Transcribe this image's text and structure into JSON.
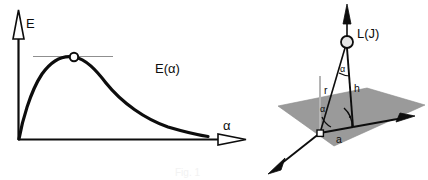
{
  "figure": {
    "kind": "two-panel-scientific-diagram",
    "background_color": "#ffffff",
    "ink_color": "#0d0d0d",
    "plane_fill_color": "#9a9a9a",
    "plane_edge_color": "#8c8c8c",
    "tangent_line_color": "#8f8f8f",
    "reference_line_color": "#b5b5b5",
    "marker_fill_color": "#ffffff",
    "caption": {
      "text": "Fig. 1",
      "visible": "partially-cropped-faint"
    }
  },
  "left_panel": {
    "name": "energy-vs-angle-plot",
    "axes": {
      "y_label": "E",
      "x_label": "α",
      "y_arrow_style": "hollow",
      "x_arrow_style": "hollow",
      "origin": {
        "x": 18,
        "y": 140
      },
      "y_axis_top": {
        "x": 18,
        "y": 14
      },
      "x_axis_end": {
        "x": 245,
        "y": 140
      }
    },
    "curve": {
      "label": "E(α)",
      "label_position": {
        "x": 155,
        "y": 72
      },
      "stroke_width": 3.2
    },
    "maximum_marker": {
      "name": "curve-maximum-point",
      "shape": "open-circle",
      "position": {
        "x": 74,
        "y": 57
      },
      "radius": 4.2
    },
    "tangent_line": {
      "name": "horizontal-tangent-at-maximum",
      "from": {
        "x": 33,
        "y": 56
      },
      "to": {
        "x": 113,
        "y": 56
      }
    }
  },
  "right_panel": {
    "name": "three-dimensional-geometry-diagram",
    "source_label": "L(J)",
    "source_label_position": {
      "x": 357,
      "y": 36
    },
    "source_marker": {
      "name": "light-source-point",
      "shape": "open-circle",
      "position": {
        "x": 347,
        "y": 42
      },
      "radius": 6
    },
    "base_marker": {
      "name": "observation-point",
      "shape": "open-square",
      "position": {
        "x": 320,
        "y": 133
      },
      "size": 6
    },
    "segments": [
      {
        "name": "slant-distance",
        "label": "r",
        "label_position": {
          "x": 327,
          "y": 90
        }
      },
      {
        "name": "source-height",
        "label": "h",
        "label_position": {
          "x": 352,
          "y": 89
        }
      },
      {
        "name": "ground-distance",
        "label": "a",
        "label_position": {
          "x": 337,
          "y": 140
        }
      }
    ],
    "angles": [
      {
        "name": "zenith-angle-at-source",
        "label": "α",
        "label_position": {
          "x": 340,
          "y": 70
        }
      },
      {
        "name": "elevation-angle-at-base",
        "label": "α",
        "label_position": {
          "x": 323,
          "y": 108
        }
      }
    ],
    "right_angle_marker": {
      "name": "right-angle-indicator",
      "position": {
        "x": 353,
        "y": 117
      }
    },
    "plane": {
      "name": "ground-plane",
      "corners": [
        {
          "x": 278,
          "y": 106
        },
        {
          "x": 367,
          "y": 88
        },
        {
          "x": 425,
          "y": 105
        },
        {
          "x": 334,
          "y": 146
        }
      ]
    },
    "axis_arrows": [
      {
        "name": "vertical-axis-arrow",
        "direction": "up",
        "style": "solid"
      },
      {
        "name": "front-left-axis-arrow",
        "direction": "down-left",
        "style": "solid"
      },
      {
        "name": "right-axis-arrow",
        "direction": "right-down",
        "style": "solid"
      }
    ]
  }
}
